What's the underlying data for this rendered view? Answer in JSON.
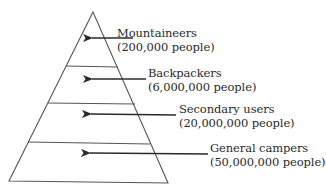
{
  "diagram": {
    "type": "pyramid",
    "stroke_color": "#555555",
    "arrow_color": "#2a2a2a",
    "text_color": "#2a2a2a",
    "layers": [
      {
        "name": "Mountaineers",
        "count": "(200,000 people)"
      },
      {
        "name": "Backpackers",
        "count": "(6,000,000 people)"
      },
      {
        "name": "Secondary users",
        "count": "(20,000,000 people)"
      },
      {
        "name": "General campers",
        "count": "(50,000,000 people)"
      }
    ]
  }
}
